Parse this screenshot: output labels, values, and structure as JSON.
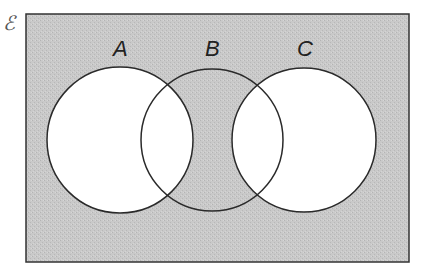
{
  "diagram": {
    "type": "venn",
    "universal_set_symbol": "ℰ",
    "sets": [
      {
        "name": "A",
        "label": "A",
        "cx": 120,
        "cy": 140,
        "r": 73
      },
      {
        "name": "B",
        "label": "B",
        "cx": 212,
        "cy": 140,
        "r": 71
      },
      {
        "name": "C",
        "label": "C",
        "cx": 304,
        "cy": 140,
        "r": 72
      }
    ],
    "shaded_region": "(A ∪ C)′",
    "colors": {
      "shade": "#c8c8c8",
      "outline": "#2a2a2a",
      "unshaded": "#ffffff"
    }
  }
}
